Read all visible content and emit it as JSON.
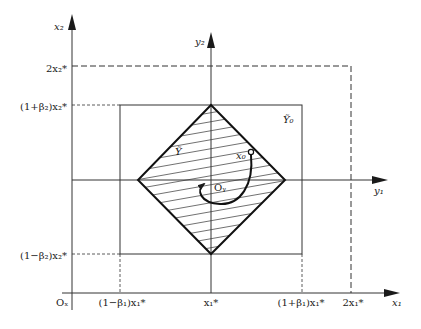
{
  "diagram": {
    "axes": {
      "x_outer": {
        "horizontal": "x₁",
        "vertical": "x₂",
        "origin": "Oₓ"
      },
      "y_inner": {
        "horizontal": "y₁",
        "vertical": "y₂",
        "origin": "Oᵧ"
      }
    },
    "x1_ticks": [
      "(1−β₁)x₁*",
      "x₁*",
      "(1+β₁)x₁*",
      "2x₁*"
    ],
    "x2_ticks": [
      "2x₂*",
      "(1+β₂)x₂*",
      "(1−β₂)x₂*"
    ],
    "regions": {
      "diamond": "Ỹ",
      "rectangle": "Ỹ₀"
    },
    "point": "x₀",
    "colors": {
      "ink": "#1a1a1a",
      "background": "#ffffff"
    }
  }
}
